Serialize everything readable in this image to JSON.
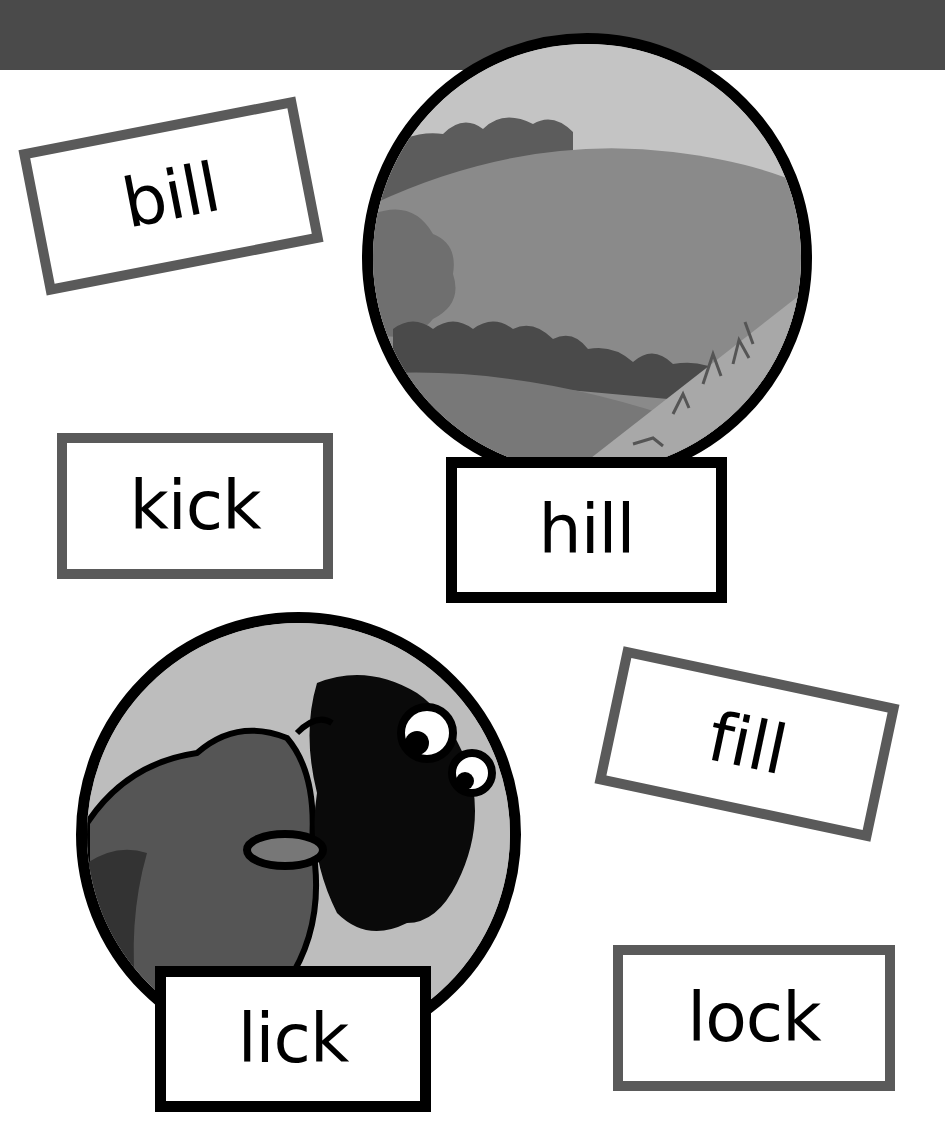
{
  "page": {
    "header_band_color": "#4a4a4a",
    "card_border_grey": "#5a5a5a",
    "card_border_black": "#000000"
  },
  "word_cards": [
    {
      "id": "bill",
      "label": "bill",
      "rotation_deg": -11
    },
    {
      "id": "kick",
      "label": "kick",
      "rotation_deg": 0
    },
    {
      "id": "fill",
      "label": "fill",
      "rotation_deg": 12
    },
    {
      "id": "lock",
      "label": "lock",
      "rotation_deg": 0
    }
  ],
  "picture_cards": [
    {
      "id": "hill",
      "label": "hill",
      "picture": "hill-landscape"
    },
    {
      "id": "lick",
      "label": "lick",
      "picture": "sheep-licking"
    }
  ]
}
